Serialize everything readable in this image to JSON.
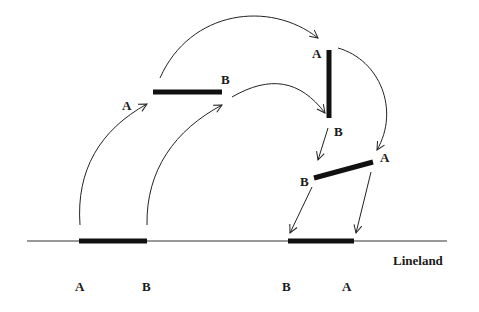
{
  "diagram": {
    "caption_label": "Lineland",
    "segments": [
      {
        "name": "lineland-original",
        "a_label": "A",
        "b_label": "B"
      },
      {
        "name": "lifted-horizontal",
        "a_label": "A",
        "b_label": "B"
      },
      {
        "name": "rotated-vertical",
        "a_label": "A",
        "b_label": "B"
      },
      {
        "name": "rotated-slanted",
        "a_label": "A",
        "b_label": "B"
      },
      {
        "name": "lineland-reflected",
        "a_label": "B",
        "b_label": "A"
      }
    ],
    "bottom_labels": [
      "A",
      "B",
      "B",
      "A"
    ]
  }
}
